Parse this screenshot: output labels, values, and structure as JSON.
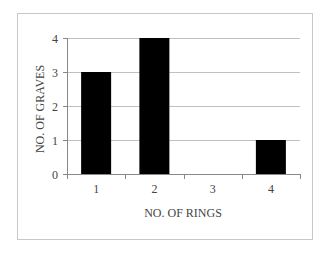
{
  "chart_data": {
    "type": "bar",
    "title": "",
    "xlabel": "NO. OF RINGS",
    "ylabel": "NO. OF GRAVES",
    "categories": [
      "1",
      "2",
      "3",
      "4"
    ],
    "values": [
      3,
      4,
      0,
      1
    ],
    "ylim": [
      0,
      4
    ],
    "yticks": [
      "0",
      "1",
      "2",
      "3",
      "4"
    ],
    "grid": true,
    "legend": null,
    "bar_color": "#000000",
    "grid_color": "#c0c0c0"
  }
}
